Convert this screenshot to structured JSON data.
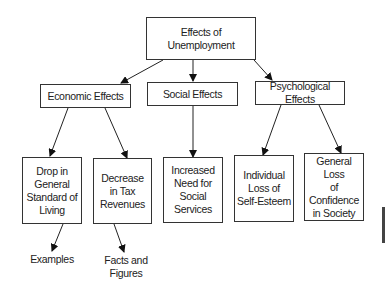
{
  "diagram": {
    "root": {
      "label_lines": [
        "Effects of",
        "Unemployment"
      ]
    },
    "categories": [
      {
        "label": "Economic Effects"
      },
      {
        "label": "Social Effects"
      },
      {
        "label": "Psychological Effects"
      }
    ],
    "details": [
      {
        "parent": "Economic Effects",
        "label_lines": [
          "Drop in",
          "General",
          "Standard of",
          "Living"
        ]
      },
      {
        "parent": "Economic Effects",
        "label_lines": [
          "Decrease",
          "in Tax",
          "Revenues"
        ]
      },
      {
        "parent": "Social Effects",
        "label_lines": [
          "Increased",
          "Need for",
          "Social Services"
        ]
      },
      {
        "parent": "Psychological Effects",
        "label_lines": [
          "Individual",
          "Loss of",
          "Self-Esteem"
        ]
      },
      {
        "parent": "Psychological Effects",
        "label_lines": [
          "General Loss",
          "of Confidence",
          "in Society"
        ]
      }
    ],
    "supports": [
      {
        "parent": "Drop in General Standard of Living",
        "label_lines": [
          "Examples"
        ]
      },
      {
        "parent": "Decrease in Tax Revenues",
        "label_lines": [
          "Facts and",
          "Figures"
        ]
      }
    ]
  }
}
